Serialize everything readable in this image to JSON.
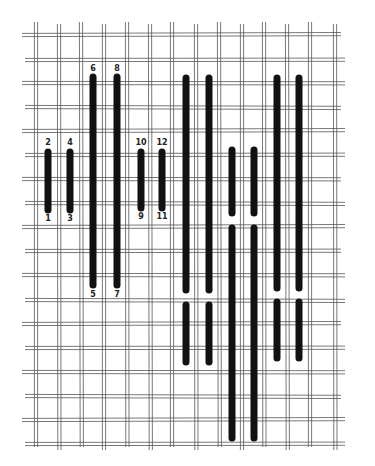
{
  "diagram": {
    "title": "",
    "colors": {
      "background": "#ffffff",
      "grid": "#555555",
      "stitch": "#111111",
      "label": "#222222"
    },
    "grid": {
      "type": "double-thread canvas",
      "vertical_lines_x": [
        36,
        59,
        81,
        104,
        127,
        150,
        172,
        196,
        219,
        242,
        264,
        287,
        310,
        335
      ],
      "horizontal_lines_y": [
        35,
        60,
        83,
        107,
        131,
        155,
        179,
        203,
        227,
        251,
        275,
        300,
        324,
        348,
        372,
        396,
        420,
        444
      ],
      "x_start": 22,
      "x_end": 345,
      "y_start": 22,
      "y_end": 450
    },
    "stitches": [
      {
        "id": "1-2",
        "x": 48,
        "y1": 152,
        "y2": 210
      },
      {
        "id": "3-4",
        "x": 70,
        "y1": 152,
        "y2": 210
      },
      {
        "id": "5-6",
        "x": 93,
        "y1": 77,
        "y2": 285
      },
      {
        "id": "7-8",
        "x": 117,
        "y1": 77,
        "y2": 285
      },
      {
        "id": "9-10",
        "x": 141,
        "y1": 152,
        "y2": 208
      },
      {
        "id": "11-12",
        "x": 162,
        "y1": 152,
        "y2": 208
      },
      {
        "id": "a-top",
        "x": 186,
        "y1": 78,
        "y2": 290
      },
      {
        "id": "a-bot",
        "x": 186,
        "y1": 305,
        "y2": 362
      },
      {
        "id": "b-top",
        "x": 209,
        "y1": 78,
        "y2": 290
      },
      {
        "id": "b-bot",
        "x": 209,
        "y1": 305,
        "y2": 362
      },
      {
        "id": "c-top",
        "x": 232,
        "y1": 150,
        "y2": 213
      },
      {
        "id": "c-bot",
        "x": 232,
        "y1": 228,
        "y2": 438
      },
      {
        "id": "d-top",
        "x": 254,
        "y1": 150,
        "y2": 213
      },
      {
        "id": "d-bot",
        "x": 254,
        "y1": 228,
        "y2": 438
      },
      {
        "id": "e-top",
        "x": 277,
        "y1": 78,
        "y2": 288
      },
      {
        "id": "e-bot",
        "x": 277,
        "y1": 302,
        "y2": 358
      },
      {
        "id": "f-top",
        "x": 299,
        "y1": 78,
        "y2": 288
      },
      {
        "id": "f-bot",
        "x": 299,
        "y1": 302,
        "y2": 358
      }
    ],
    "labels": [
      {
        "text": "2",
        "x": 48,
        "y": 139
      },
      {
        "text": "4",
        "x": 70,
        "y": 139
      },
      {
        "text": "6",
        "x": 93,
        "y": 65
      },
      {
        "text": "8",
        "x": 117,
        "y": 65
      },
      {
        "text": "10",
        "x": 141,
        "y": 139
      },
      {
        "text": "12",
        "x": 162,
        "y": 139
      },
      {
        "text": "1",
        "x": 48,
        "y": 215
      },
      {
        "text": "3",
        "x": 70,
        "y": 215
      },
      {
        "text": "9",
        "x": 141,
        "y": 213
      },
      {
        "text": "11",
        "x": 162,
        "y": 213
      },
      {
        "text": "5",
        "x": 93,
        "y": 291
      },
      {
        "text": "7",
        "x": 117,
        "y": 291
      }
    ]
  }
}
